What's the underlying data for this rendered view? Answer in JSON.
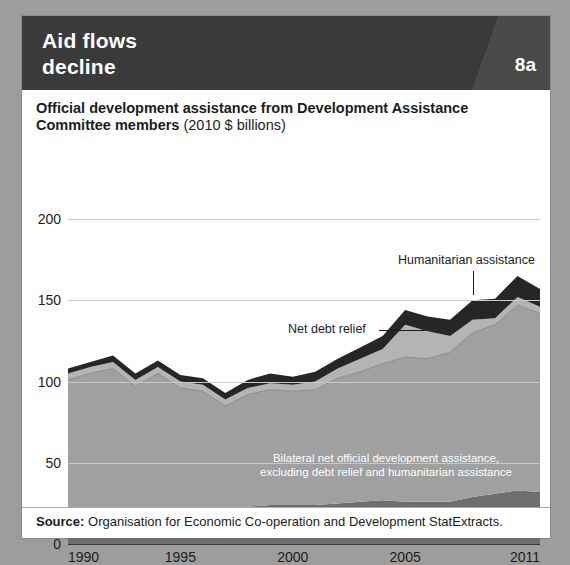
{
  "header": {
    "title": "Aid flows\ndecline",
    "figure_number": "8a",
    "bar_color": "#3a3a3a",
    "wedge_color": "#4a4a4a"
  },
  "chart_title": {
    "strong": "Official development assistance from Development Assistance Committee members",
    "light": " (2010 $ billions)"
  },
  "source": {
    "label": "Source:",
    "text": " Organisation for Economic Co-operation and Development StatExtracts."
  },
  "annotations": {
    "humanitarian": "Humanitarian assistance",
    "debt_relief": "Net debt relief",
    "bilateral": "Bilateral net official development assistance,\nexcluding debt relief and humanitarian assistance",
    "multilateral": "Multilateral net official development assistance,\nexcluding debt relief and humanitarian assistance"
  },
  "chart_data": {
    "type": "area",
    "stacked": true,
    "title": "Official development assistance from Development Assistance Committee members (2010 $ billions)",
    "xlabel": "",
    "ylabel": "2010 $ billions",
    "ylim": [
      0,
      200
    ],
    "xlim": [
      1990,
      2011
    ],
    "yticks": [
      0,
      50,
      100,
      150,
      200
    ],
    "xticks": [
      1990,
      1995,
      2000,
      2005,
      2011
    ],
    "grid": true,
    "legend_position": "in-plot-annotations",
    "x": [
      1990,
      1991,
      1992,
      1993,
      1994,
      1995,
      1996,
      1997,
      1998,
      1999,
      2000,
      2001,
      2002,
      2003,
      2004,
      2005,
      2006,
      2007,
      2008,
      2009,
      2010,
      2011
    ],
    "series": [
      {
        "name": "Multilateral net official development assistance, excluding debt relief and humanitarian assistance",
        "color": "#6e6e6e",
        "values": [
          21,
          22,
          22,
          21,
          22,
          22,
          22,
          21,
          23,
          24,
          24,
          24,
          25,
          26,
          27,
          26,
          26,
          26,
          29,
          31,
          33,
          32
        ]
      },
      {
        "name": "Bilateral net official development assistance, excluding debt relief and humanitarian assistance",
        "color": "#a0a0a0",
        "values": [
          80,
          83,
          86,
          76,
          83,
          74,
          72,
          64,
          69,
          71,
          70,
          71,
          77,
          80,
          84,
          89,
          88,
          92,
          101,
          104,
          114,
          110
        ]
      },
      {
        "name": "Net debt relief",
        "color": "#b4b4b4",
        "values": [
          4,
          4,
          4,
          4,
          4,
          4,
          4,
          4,
          4,
          4,
          4,
          5,
          6,
          8,
          9,
          20,
          17,
          10,
          8,
          4,
          5,
          4
        ]
      },
      {
        "name": "Humanitarian assistance",
        "color": "#262626",
        "values": [
          3,
          3,
          4,
          4,
          4,
          4,
          4,
          4,
          5,
          6,
          5,
          6,
          6,
          7,
          8,
          9,
          9,
          10,
          12,
          12,
          13,
          11
        ]
      }
    ],
    "totals": [
      108,
      112,
      116,
      105,
      113,
      104,
      102,
      93,
      101,
      105,
      103,
      106,
      114,
      121,
      128,
      144,
      140,
      138,
      150,
      151,
      165,
      157
    ]
  }
}
